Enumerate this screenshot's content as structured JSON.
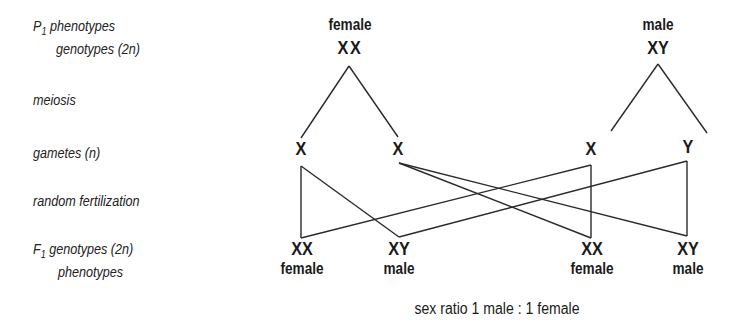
{
  "row_labels": {
    "p1_prefix": "P",
    "p1_sub": "1",
    "p1_phenotypes": "phenotypes",
    "p1_genotypes": "genotypes (2n)",
    "meiosis": "meiosis",
    "gametes": "gametes (n)",
    "fertilization": "random fertilization",
    "f1_prefix": "F",
    "f1_sub": "1",
    "f1_genotypes": "genotypes (2n)",
    "f1_phenotypes": "phenotypes"
  },
  "parents": {
    "female": {
      "phenotype": "female",
      "genotype": "XX"
    },
    "male": {
      "phenotype": "male",
      "genotype": "XY"
    }
  },
  "gametes": [
    {
      "label": "X",
      "parent": "female"
    },
    {
      "label": "X",
      "parent": "female"
    },
    {
      "label": "X",
      "parent": "male"
    },
    {
      "label": "Y",
      "parent": "male"
    }
  ],
  "offspring": [
    {
      "genotype": "XX",
      "phenotype": "female"
    },
    {
      "genotype": "XY",
      "phenotype": "male"
    },
    {
      "genotype": "XX",
      "phenotype": "female"
    },
    {
      "genotype": "XY",
      "phenotype": "male"
    }
  ],
  "summary": "sex ratio 1 male : 1 female",
  "line_color": "#2a2a2a"
}
